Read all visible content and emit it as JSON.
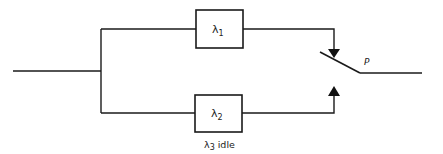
{
  "diagram": {
    "components": [
      {
        "id": "unit1",
        "symbol": "λ",
        "subscript": "1",
        "role": "primary unit"
      },
      {
        "id": "unit2",
        "symbol": "λ",
        "subscript": "2",
        "role": "standby unit"
      }
    ],
    "standby_note": {
      "symbol": "λ",
      "subscript": "3",
      "text": "idle"
    },
    "switch": {
      "label": "P"
    },
    "colors": {
      "line": "#1a1a1a",
      "background": "#ffffff"
    }
  }
}
